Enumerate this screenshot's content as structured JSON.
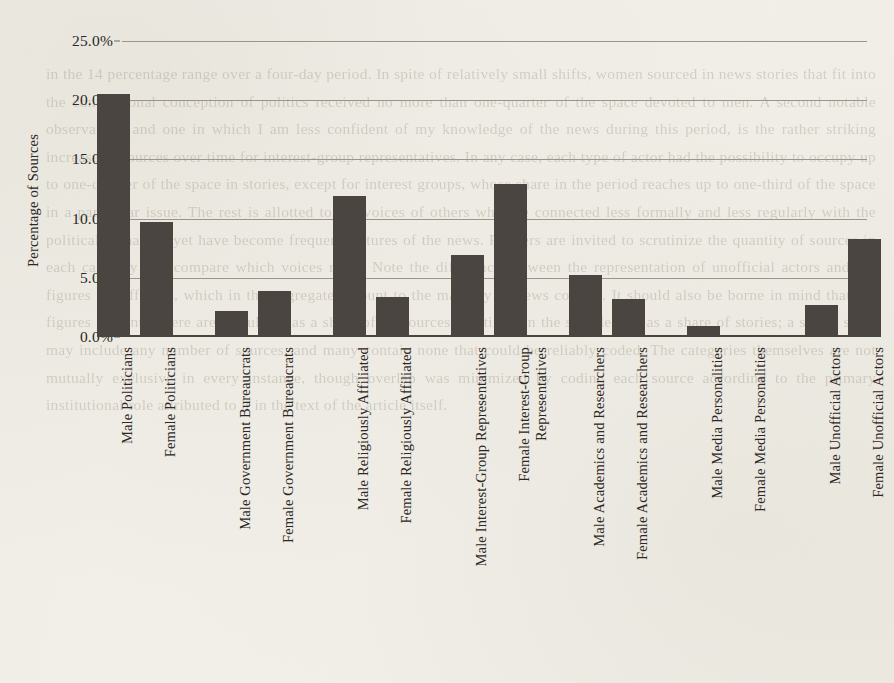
{
  "chart_data": {
    "type": "bar",
    "title": "",
    "subtitle": "",
    "xlabel": "",
    "ylabel": "Percentage of Sources",
    "ylim": [
      0,
      25
    ],
    "yticks": [
      0,
      5,
      10,
      15,
      20,
      25
    ],
    "ytick_labels": [
      "0.0%",
      "5.0%",
      "10.0%",
      "15.0%",
      "20.0%",
      "25.0%"
    ],
    "grid": true,
    "legend": "none",
    "value_unit": "percent",
    "bar_color": "#4a4540",
    "background_color": "#f3f1ea",
    "gridline_color": "#9b948a",
    "categories": [
      "Male Politicians",
      "Female Politicians",
      "Male Government Bureaucrats",
      "Female Government Bureaucrats",
      "Male Religiously Affiliated",
      "Female Religiously Affiliated",
      "Male Interest-Group Representatives",
      "Female Interest-Group Representatives",
      "Male Academics and Researchers",
      "Female Academics and Researchers",
      "Male Media Personalities",
      "Female Media Personalities",
      "Male Unofficial Actors",
      "Female Unofficial Actors"
    ],
    "values": [
      20.5,
      9.7,
      2.2,
      3.9,
      11.9,
      3.4,
      6.9,
      12.9,
      5.2,
      3.2,
      0.9,
      0.0,
      2.7,
      8.3
    ]
  },
  "axis": {
    "y_title": "Percentage of Sources"
  },
  "category_label_lines": [
    [
      "Male Politicians",
      ""
    ],
    [
      "Female Politicians",
      ""
    ],
    [
      "Male Government Bureaucrats",
      ""
    ],
    [
      "Female Government Bureaucrats",
      ""
    ],
    [
      "Male Religiously Affiliated",
      ""
    ],
    [
      "Female Religiously Affiliated",
      ""
    ],
    [
      "Male Interest-Group Representatives",
      ""
    ],
    [
      "Female Interest-Group",
      "Representatives"
    ],
    [
      "Male Academics and Researchers",
      ""
    ],
    [
      "Female Academics and Researchers",
      ""
    ],
    [
      "Male Media Personalities",
      ""
    ],
    [
      "Female Media Personalities",
      ""
    ],
    [
      "Male Unofficial Actors",
      ""
    ],
    [
      "Female Unofficial Actors",
      ""
    ]
  ],
  "page_bleed_text": "in the 14 percentage range over a four-day period. In spite of relatively small shifts, women sourced in news stories that fit into the conventional conception of politics received no more than one-quarter of the space devoted to men. A second notable observation, and one in which I am less confident of my knowledge of the news during this period, is the rather striking increase in sources over time for interest-group representatives. In any case, each type of actor had the possibility to occupy up to one-quarter of the space in stories, except for interest groups, whose share in the period reaches up to one-third of the space in a particular issue. The rest is allotted to the voices of others who are connected less formally and less regularly with the political arena and yet have become frequent fixtures of the news. Readers are invited to scrutinize the quantity of sources in each category and compare which voices recur. Note the difference between the representation of unofficial actors and the figures for officials, which in the aggregate amount to the majority of news content. It should also be borne in mind that the figures presented here are calculated as a share of all sources identified in the sample, not as a share of stories; a single story may include any number of sources, and many contain none that could be reliably coded. The categories themselves are not mutually exclusive in every instance, though overlap was minimized by coding each source according to the primary institutional role attributed to it in the text of the article itself."
}
